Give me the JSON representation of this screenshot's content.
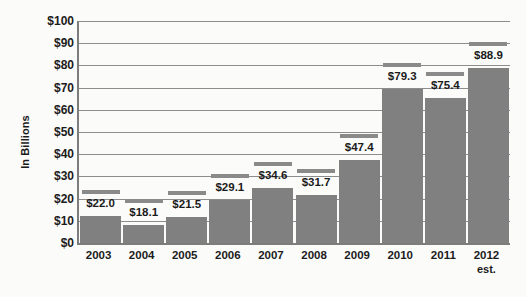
{
  "chart_data": {
    "type": "bar",
    "title": "",
    "xlabel": "",
    "ylabel": "In Billions",
    "ylim": [
      0,
      100
    ],
    "ytick_step": 10,
    "grid": true,
    "legend": null,
    "categories": [
      "2003",
      "2004",
      "2005",
      "2006",
      "2007",
      "2008",
      "2009",
      "2010",
      "2011",
      "2012"
    ],
    "category_sublabels": [
      "",
      "",
      "",
      "",
      "",
      "",
      "",
      "",
      "",
      "est."
    ],
    "values": [
      22.0,
      18.1,
      21.5,
      29.1,
      34.6,
      31.7,
      47.4,
      79.3,
      75.4,
      88.9
    ],
    "data_labels": [
      "$22.0",
      "$18.1",
      "$21.5",
      "$29.1",
      "$34.6",
      "$31.7",
      "$47.4",
      "$79.3",
      "$75.4",
      "$88.9"
    ],
    "ytick_labels": [
      "$100",
      "$90",
      "$80",
      "$70",
      "$60",
      "$50",
      "$40",
      "$30",
      "$20",
      "$10",
      "$0"
    ],
    "ytick_values": [
      100,
      90,
      80,
      70,
      60,
      50,
      40,
      30,
      20,
      10,
      0
    ],
    "colors": {
      "bar": "#808080",
      "bar_cap": "#8a8a8a",
      "gridline": "#8d8d8d",
      "axis": "#7d7d7d",
      "text": "#1b1b1b",
      "background": "#fbfbfa"
    }
  }
}
